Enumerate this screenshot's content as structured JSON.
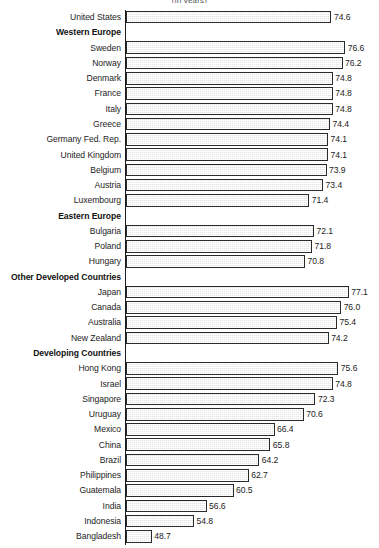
{
  "subtitle": "(in years)",
  "axis": {
    "origin_value": 45.0,
    "px_per_unit": 6.94
  },
  "style": {
    "bar_fill": "#e3e3e3",
    "bar_border": "#2a2a2a",
    "text_color": "#1c1c1c",
    "background": "#ffffff"
  },
  "chart_data": {
    "type": "bar",
    "title": "",
    "subtitle": "(in years)",
    "xlabel": "",
    "ylabel": "",
    "orientation": "horizontal",
    "grid": false,
    "legend": null,
    "value_labels": true,
    "xlim": [
      45.0,
      79.0
    ],
    "categories": [
      "United States",
      "Western Europe",
      "Sweden",
      "Norway",
      "Denmark",
      "France",
      "Italy",
      "Greece",
      "Germany Fed. Rep.",
      "United Kingdom",
      "Belgium",
      "Austria",
      "Luxembourg",
      "Eastern Europe",
      "Bulgaria",
      "Poland",
      "Hungary",
      "Other Developed Countries",
      "Japan",
      "Canada",
      "Australia",
      "New Zealand",
      "Developing Countries",
      "Hong Kong",
      "Israel",
      "Singapore",
      "Uruguay",
      "Mexico",
      "China",
      "Brazil",
      "Philippines",
      "Guatemala",
      "India",
      "Indonesia",
      "Bangladesh"
    ],
    "values": [
      74.6,
      null,
      76.6,
      76.2,
      74.8,
      74.8,
      74.8,
      74.4,
      74.1,
      74.1,
      73.9,
      73.4,
      71.4,
      null,
      72.1,
      71.8,
      70.8,
      null,
      77.1,
      76.0,
      75.4,
      74.2,
      null,
      75.6,
      74.8,
      72.3,
      70.6,
      66.4,
      65.8,
      64.2,
      62.7,
      60.5,
      56.6,
      54.8,
      48.7
    ],
    "group_headers": [
      "Western Europe",
      "Eastern Europe",
      "Other Developed Countries",
      "Developing Countries"
    ]
  },
  "rows": [
    {
      "label": "United States",
      "value": 74.6,
      "value_text": "74.6",
      "group": false
    },
    {
      "label": "Western Europe",
      "value": null,
      "value_text": "",
      "group": true
    },
    {
      "label": "Sweden",
      "value": 76.6,
      "value_text": "76.6",
      "group": false
    },
    {
      "label": "Norway",
      "value": 76.2,
      "value_text": "76.2",
      "group": false
    },
    {
      "label": "Denmark",
      "value": 74.8,
      "value_text": "74.8",
      "group": false
    },
    {
      "label": "France",
      "value": 74.8,
      "value_text": "74.8",
      "group": false
    },
    {
      "label": "Italy",
      "value": 74.8,
      "value_text": "74.8",
      "group": false
    },
    {
      "label": "Greece",
      "value": 74.4,
      "value_text": "74.4",
      "group": false
    },
    {
      "label": "Germany Fed. Rep.",
      "value": 74.1,
      "value_text": "74.1",
      "group": false
    },
    {
      "label": "United Kingdom",
      "value": 74.1,
      "value_text": "74.1",
      "group": false
    },
    {
      "label": "Belgium",
      "value": 73.9,
      "value_text": "73.9",
      "group": false
    },
    {
      "label": "Austria",
      "value": 73.4,
      "value_text": "73.4",
      "group": false
    },
    {
      "label": "Luxembourg",
      "value": 71.4,
      "value_text": "71.4",
      "group": false
    },
    {
      "label": "Eastern Europe",
      "value": null,
      "value_text": "",
      "group": true
    },
    {
      "label": "Bulgaria",
      "value": 72.1,
      "value_text": "72.1",
      "group": false
    },
    {
      "label": "Poland",
      "value": 71.8,
      "value_text": "71.8",
      "group": false
    },
    {
      "label": "Hungary",
      "value": 70.8,
      "value_text": "70.8",
      "group": false
    },
    {
      "label": "Other Developed Countries",
      "value": null,
      "value_text": "",
      "group": true
    },
    {
      "label": "Japan",
      "value": 77.1,
      "value_text": "77.1",
      "group": false
    },
    {
      "label": "Canada",
      "value": 76.0,
      "value_text": "76.0",
      "group": false
    },
    {
      "label": "Australia",
      "value": 75.4,
      "value_text": "75.4",
      "group": false
    },
    {
      "label": "New Zealand",
      "value": 74.2,
      "value_text": "74.2",
      "group": false
    },
    {
      "label": "Developing Countries",
      "value": null,
      "value_text": "",
      "group": true
    },
    {
      "label": "Hong Kong",
      "value": 75.6,
      "value_text": "75.6",
      "group": false
    },
    {
      "label": "Israel",
      "value": 74.8,
      "value_text": "74.8",
      "group": false
    },
    {
      "label": "Singapore",
      "value": 72.3,
      "value_text": "72.3",
      "group": false
    },
    {
      "label": "Uruguay",
      "value": 70.6,
      "value_text": "70.6",
      "group": false
    },
    {
      "label": "Mexico",
      "value": 66.4,
      "value_text": "66.4",
      "group": false
    },
    {
      "label": "China",
      "value": 65.8,
      "value_text": "65.8",
      "group": false
    },
    {
      "label": "Brazil",
      "value": 64.2,
      "value_text": "64.2",
      "group": false
    },
    {
      "label": "Philippines",
      "value": 62.7,
      "value_text": "62.7",
      "group": false
    },
    {
      "label": "Guatemala",
      "value": 60.5,
      "value_text": "60.5",
      "group": false
    },
    {
      "label": "India",
      "value": 56.6,
      "value_text": "56.6",
      "group": false
    },
    {
      "label": "Indonesia",
      "value": 54.8,
      "value_text": "54.8",
      "group": false
    },
    {
      "label": "Bangladesh",
      "value": 48.7,
      "value_text": "48.7",
      "group": false
    }
  ]
}
